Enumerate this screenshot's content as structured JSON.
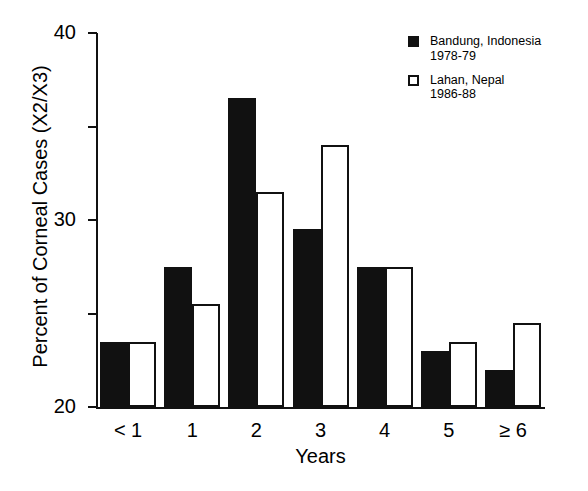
{
  "chart_data": {
    "type": "bar",
    "title": "",
    "xlabel": "Years",
    "ylabel": "Percent of Corneal Cases (X2/X3)",
    "categories": [
      "< 1",
      "1",
      "2",
      "3",
      "4",
      "5",
      "≥ 6"
    ],
    "series": [
      {
        "name": "Bandung, Indonesia",
        "period": "1978-79",
        "style": "filled",
        "color": "#111111",
        "values": [
          7,
          15,
          33,
          19,
          15,
          6,
          4
        ]
      },
      {
        "name": "Lahan, Nepal",
        "period": "1986-88",
        "style": "open",
        "color": "#ffffff",
        "values": [
          7,
          11,
          23,
          28,
          15,
          7,
          9
        ]
      }
    ],
    "ylim": [
      0,
      40
    ],
    "yticks": [
      0,
      10,
      20,
      30,
      40
    ],
    "ytick_labels": [
      "0",
      "10",
      "20",
      "30",
      "40"
    ],
    "grid": false,
    "legend_position": "top-right"
  },
  "legend": {
    "entries": [
      {
        "label": "Bandung, Indonesia",
        "sublabel": "1978-79",
        "swatch": "filled-square"
      },
      {
        "label": "Lahan, Nepal",
        "sublabel": "1986-88",
        "swatch": "open-square"
      }
    ]
  }
}
